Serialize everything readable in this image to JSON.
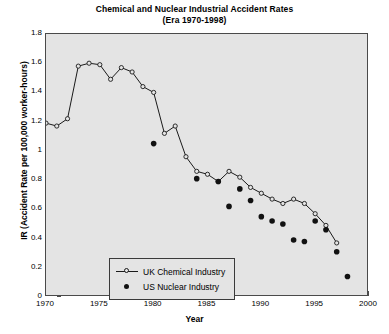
{
  "chart_data": {
    "type": "line",
    "title": "Chemical and Nuclear Industrial Accident Rates",
    "subtitle": "(Era 1970-1998)",
    "xlabel": "Year",
    "ylabel": "IR (Accident Rate per 100,000 worker-hours)",
    "xlim": [
      1970,
      2000
    ],
    "ylim": [
      0,
      1.8
    ],
    "xticks": [
      1970,
      1975,
      1980,
      1985,
      1990,
      1995,
      2000
    ],
    "yticks": [
      0,
      0.2,
      0.4,
      0.6,
      0.8,
      1,
      1.2,
      1.4,
      1.6,
      1.8
    ],
    "ytick_labels": [
      "0",
      "0.2",
      "0.4",
      "0.6",
      "0.8",
      "1",
      "1.2",
      "1.4",
      "1.6",
      "1.8"
    ],
    "grid": false,
    "legend_position": "lower-left",
    "series": [
      {
        "name": "UK Chemical Industry",
        "marker": "open-circle",
        "line": true,
        "color": "#1a1a1a",
        "x": [
          1970,
          1971,
          1972,
          1973,
          1974,
          1975,
          1976,
          1977,
          1978,
          1979,
          1980,
          1981,
          1982,
          1983,
          1984,
          1985,
          1986,
          1987,
          1988,
          1989,
          1990,
          1991,
          1992,
          1993,
          1994,
          1995,
          1996,
          1997
        ],
        "values": [
          1.19,
          1.17,
          1.22,
          1.58,
          1.6,
          1.59,
          1.49,
          1.57,
          1.54,
          1.44,
          1.4,
          1.12,
          1.17,
          0.96,
          0.86,
          0.84,
          0.79,
          0.86,
          0.82,
          0.75,
          0.71,
          0.67,
          0.64,
          0.67,
          0.64,
          0.57,
          0.49,
          0.37
        ]
      },
      {
        "name": "US Nuclear Industry",
        "marker": "filled-circle",
        "line": false,
        "color": "#111111",
        "x": [
          1980,
          1984,
          1986,
          1987,
          1988,
          1989,
          1990,
          1991,
          1992,
          1993,
          1994,
          1995,
          1996,
          1997,
          1998
        ],
        "values": [
          1.05,
          0.81,
          0.79,
          0.62,
          0.74,
          0.66,
          0.55,
          0.52,
          0.5,
          0.39,
          0.38,
          0.52,
          0.46,
          0.31,
          0.14
        ]
      }
    ]
  },
  "style": {
    "plot_background": "#e4e4e4",
    "page_background": "#ffffff",
    "axis_color": "#4a4a4a",
    "series1_color": "#1a1a1a",
    "series2_color": "#111111"
  }
}
